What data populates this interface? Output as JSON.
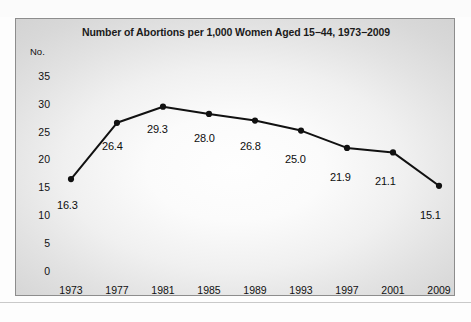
{
  "chart_data": {
    "type": "line",
    "title": "Number of Abortions per 1,000 Women Aged 15−44, 1973−2009",
    "xlabel": "",
    "ylabel": "No.",
    "categories": [
      "1973",
      "1977",
      "1981",
      "1985",
      "1989",
      "1993",
      "1997",
      "2001",
      "2009"
    ],
    "values": [
      16.3,
      26.4,
      29.3,
      28.0,
      26.8,
      25.0,
      21.9,
      21.1,
      15.1
    ],
    "point_labels": [
      "16.3",
      "26.4",
      "29.3",
      "28.0",
      "26.8",
      "25.0",
      "21.9",
      "21.1",
      "15.1"
    ],
    "ylim": [
      0,
      35
    ],
    "yticks": [
      "35",
      "30",
      "25",
      "20",
      "15",
      "10",
      "5",
      "0"
    ],
    "ytick_values": [
      35,
      30,
      25,
      20,
      15,
      10,
      5,
      0
    ],
    "grid": false,
    "legend": "none",
    "series_color": "#111111",
    "marker": "circle",
    "marker_color": "#111111",
    "panel_border_color": "#8d8d8d",
    "text_color": "#111111"
  },
  "chart": {
    "y_axis_unit": "No."
  }
}
